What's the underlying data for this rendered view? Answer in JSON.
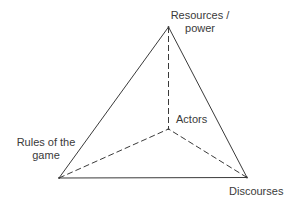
{
  "diagram": {
    "type": "tetrahedron",
    "colors": {
      "line": "#3a3a3a",
      "text": "#3a3a3a",
      "background": "#ffffff"
    },
    "nodes": {
      "resources": {
        "line1": "Resources /",
        "line2": "power"
      },
      "actors": {
        "label": "Actors"
      },
      "rules": {
        "line1": "Rules of the",
        "line2": "game"
      },
      "discourses": {
        "label": "Discourses"
      }
    },
    "edges": [
      {
        "from": "resources",
        "to": "rules",
        "style": "solid"
      },
      {
        "from": "resources",
        "to": "discourses",
        "style": "solid"
      },
      {
        "from": "rules",
        "to": "discourses",
        "style": "solid"
      },
      {
        "from": "resources",
        "to": "actors",
        "style": "dashed"
      },
      {
        "from": "rules",
        "to": "actors",
        "style": "dashed"
      },
      {
        "from": "discourses",
        "to": "actors",
        "style": "dashed"
      }
    ]
  }
}
